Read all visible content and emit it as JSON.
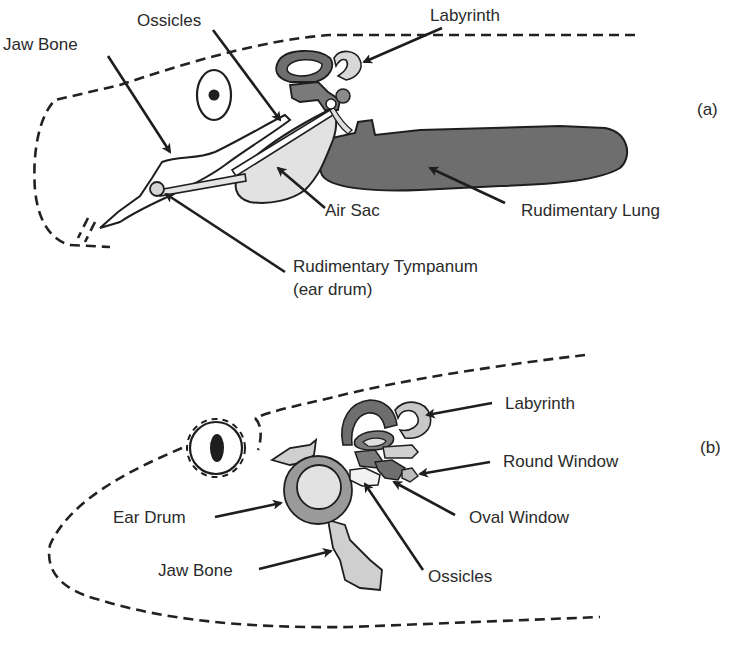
{
  "figure": {
    "panels": [
      {
        "id": "a",
        "tag": "(a)",
        "labels": {
          "jaw_bone": "Jaw Bone",
          "ossicles": "Ossicles",
          "labyrinth": "Labyrinth",
          "air_sac": "Air Sac",
          "rudimentary_lung": "Rudimentary Lung",
          "tympanum_line1": "Rudimentary Tympanum",
          "tympanum_line2": "(ear drum)"
        }
      },
      {
        "id": "b",
        "tag": "(b)",
        "labels": {
          "labyrinth": "Labyrinth",
          "round_window": "Round Window",
          "oval_window": "Oval Window",
          "ear_drum": "Ear Drum",
          "jaw_bone": "Jaw Bone",
          "ossicles": "Ossicles"
        }
      }
    ],
    "colors": {
      "dark_gray": "#6e6e6e",
      "mid_gray": "#9a9a9a",
      "light_gray": "#d8d8d8",
      "pale_gray": "#e6e6e6",
      "stroke": "#1e1e1e"
    }
  }
}
